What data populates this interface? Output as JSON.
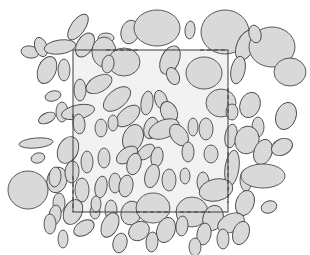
{
  "figure": {
    "title": "Boolean model of ellipses with rectangular sampling window",
    "canvas": {
      "width": 310,
      "height": 255
    },
    "background_color": "#ffffff"
  },
  "style": {
    "ellipse_fill": "#d9d9d9",
    "ellipse_stroke": "#4a4a4a",
    "ellipse_stroke_width": 0.9,
    "window_fill": "#f2f2f2",
    "window_stroke": "#3c3c3c",
    "window_stroke_width": 1.0,
    "dash_stroke": "#3c3c3c",
    "dash_stroke_width": 1.0,
    "dash_pattern": "4,3"
  },
  "chart_data": {
    "type": "scatter",
    "title": "Boolean model of ellipses with rectangular sampling window",
    "xlabel": "",
    "ylabel": "",
    "xlim": [
      0,
      310
    ],
    "ylim": [
      0,
      255
    ],
    "grid": false,
    "legend": null,
    "counts": {
      "ellipses_total": 104,
      "window_edge_dash_segments": 8
    },
    "window": {
      "label": "sampling window",
      "x": 73,
      "y": 50,
      "width": 155,
      "height": 162,
      "fill": "#f2f2f2",
      "stroke": "#3c3c3c"
    },
    "dashes": [
      {
        "name": "top-left-chord",
        "x1": 106,
        "y1": 50,
        "x2": 139,
        "y2": 50
      },
      {
        "name": "top-right-chord",
        "x1": 200,
        "y1": 50,
        "x2": 228,
        "y2": 50
      },
      {
        "name": "right-upper-chord",
        "x1": 228,
        "y1": 88,
        "x2": 228,
        "y2": 116
      },
      {
        "name": "right-lower-chord",
        "x1": 228,
        "y1": 152,
        "x2": 228,
        "y2": 203
      },
      {
        "name": "left-lower-chord",
        "x1": 73,
        "y1": 176,
        "x2": 73,
        "y2": 212
      },
      {
        "name": "bottom-mid-chord",
        "x1": 136,
        "y1": 212,
        "x2": 170,
        "y2": 212
      },
      {
        "name": "bottom-right-chord",
        "x1": 180,
        "y1": 212,
        "x2": 210,
        "y2": 212
      },
      {
        "name": "left-upper-chord",
        "x1": 73,
        "y1": 114,
        "x2": 73,
        "y2": 120
      }
    ],
    "series": [
      {
        "name": "ellipses",
        "fields": [
          "cx",
          "cy",
          "rx",
          "ry",
          "angle_deg"
        ],
        "values": [
          [
            30,
            52,
            9,
            6,
            10
          ],
          [
            41,
            47,
            6,
            10,
            -20
          ],
          [
            60,
            47,
            16,
            7,
            -8
          ],
          [
            78,
            27,
            7,
            15,
            35
          ],
          [
            85,
            45,
            8,
            13,
            30
          ],
          [
            106,
            38,
            8,
            5,
            0
          ],
          [
            130,
            32,
            9,
            12,
            15
          ],
          [
            157,
            28,
            23,
            18,
            0
          ],
          [
            190,
            30,
            5,
            9,
            5
          ],
          [
            225,
            32,
            24,
            22,
            0
          ],
          [
            246,
            45,
            9,
            16,
            25
          ],
          [
            272,
            47,
            23,
            20,
            0
          ],
          [
            255,
            34,
            6,
            9,
            -15
          ],
          [
            47,
            70,
            9,
            14,
            22
          ],
          [
            64,
            70,
            6,
            11,
            0
          ],
          [
            104,
            52,
            12,
            15,
            0
          ],
          [
            124,
            62,
            16,
            14,
            0
          ],
          [
            108,
            64,
            6,
            9,
            10
          ],
          [
            170,
            60,
            9,
            15,
            25
          ],
          [
            173,
            76,
            6,
            9,
            -25
          ],
          [
            204,
            73,
            18,
            16,
            0
          ],
          [
            238,
            70,
            7,
            14,
            12
          ],
          [
            290,
            72,
            16,
            14,
            0
          ],
          [
            53,
            96,
            8,
            5,
            -15
          ],
          [
            80,
            90,
            6,
            11,
            0
          ],
          [
            99,
            84,
            14,
            8,
            -28
          ],
          [
            117,
            99,
            16,
            9,
            -40
          ],
          [
            128,
            116,
            14,
            8,
            -40
          ],
          [
            147,
            103,
            6,
            12,
            8
          ],
          [
            161,
            100,
            6,
            10,
            -20
          ],
          [
            169,
            112,
            8,
            11,
            -25
          ],
          [
            221,
            103,
            15,
            14,
            0
          ],
          [
            232,
            112,
            6,
            8,
            0
          ],
          [
            250,
            105,
            10,
            13,
            20
          ],
          [
            258,
            127,
            6,
            10,
            0
          ],
          [
            286,
            116,
            10,
            14,
            20
          ],
          [
            47,
            118,
            9,
            5,
            -25
          ],
          [
            62,
            112,
            6,
            10,
            0
          ],
          [
            78,
            112,
            17,
            7,
            -12
          ],
          [
            79,
            124,
            6,
            10,
            -5
          ],
          [
            101,
            128,
            6,
            9,
            0
          ],
          [
            113,
            123,
            5,
            8,
            0
          ],
          [
            133,
            138,
            10,
            14,
            20
          ],
          [
            151,
            128,
            7,
            11,
            15
          ],
          [
            164,
            129,
            16,
            9,
            -22
          ],
          [
            179,
            135,
            8,
            12,
            -35
          ],
          [
            193,
            127,
            5,
            9,
            0
          ],
          [
            206,
            129,
            7,
            11,
            0
          ],
          [
            231,
            136,
            6,
            12,
            10
          ],
          [
            247,
            140,
            12,
            14,
            15
          ],
          [
            36,
            143,
            17,
            5,
            -5
          ],
          [
            38,
            158,
            7,
            5,
            -15
          ],
          [
            68,
            150,
            10,
            14,
            25
          ],
          [
            57,
            180,
            10,
            13,
            15
          ],
          [
            72,
            172,
            7,
            11,
            5
          ],
          [
            87,
            162,
            6,
            11,
            0
          ],
          [
            104,
            158,
            6,
            10,
            0
          ],
          [
            127,
            155,
            12,
            7,
            -35
          ],
          [
            146,
            152,
            10,
            6,
            -40
          ],
          [
            134,
            164,
            7,
            11,
            15
          ],
          [
            157,
            157,
            6,
            10,
            10
          ],
          [
            188,
            152,
            6,
            10,
            0
          ],
          [
            211,
            154,
            7,
            9,
            0
          ],
          [
            232,
            168,
            7,
            18,
            8
          ],
          [
            263,
            152,
            9,
            13,
            20
          ],
          [
            282,
            147,
            11,
            8,
            -25
          ],
          [
            28,
            190,
            20,
            19,
            0
          ],
          [
            55,
            177,
            6,
            10,
            5
          ],
          [
            59,
            203,
            6,
            10,
            0
          ],
          [
            82,
            190,
            7,
            12,
            0
          ],
          [
            101,
            187,
            6,
            11,
            10
          ],
          [
            115,
            183,
            6,
            10,
            0
          ],
          [
            126,
            186,
            7,
            11,
            10
          ],
          [
            152,
            176,
            7,
            12,
            15
          ],
          [
            169,
            180,
            7,
            11,
            0
          ],
          [
            185,
            176,
            5,
            8,
            0
          ],
          [
            203,
            182,
            6,
            10,
            0
          ],
          [
            216,
            190,
            17,
            11,
            -12
          ],
          [
            246,
            180,
            6,
            11,
            0
          ],
          [
            263,
            176,
            22,
            12,
            0
          ],
          [
            245,
            203,
            9,
            13,
            20
          ],
          [
            55,
            215,
            6,
            10,
            10
          ],
          [
            73,
            212,
            9,
            13,
            25
          ],
          [
            95,
            212,
            5,
            7,
            0
          ],
          [
            111,
            210,
            6,
            10,
            0
          ],
          [
            131,
            213,
            10,
            12,
            15
          ],
          [
            153,
            208,
            17,
            15,
            0
          ],
          [
            192,
            212,
            16,
            15,
            0
          ],
          [
            213,
            218,
            10,
            13,
            20
          ],
          [
            231,
            223,
            14,
            9,
            -25
          ],
          [
            269,
            207,
            8,
            6,
            -20
          ],
          [
            50,
            224,
            6,
            10,
            0
          ],
          [
            84,
            228,
            11,
            7,
            -30
          ],
          [
            110,
            225,
            8,
            13,
            25
          ],
          [
            139,
            231,
            11,
            9,
            -35
          ],
          [
            166,
            230,
            9,
            13,
            20
          ],
          [
            182,
            226,
            6,
            10,
            5
          ],
          [
            204,
            234,
            7,
            11,
            10
          ],
          [
            223,
            239,
            6,
            10,
            0
          ],
          [
            241,
            233,
            8,
            12,
            20
          ],
          [
            63,
            239,
            5,
            9,
            0
          ],
          [
            120,
            243,
            7,
            10,
            15
          ],
          [
            152,
            242,
            6,
            10,
            5
          ],
          [
            195,
            247,
            6,
            9,
            0
          ],
          [
            96,
            204,
            5,
            8,
            0
          ]
        ]
      }
    ]
  }
}
